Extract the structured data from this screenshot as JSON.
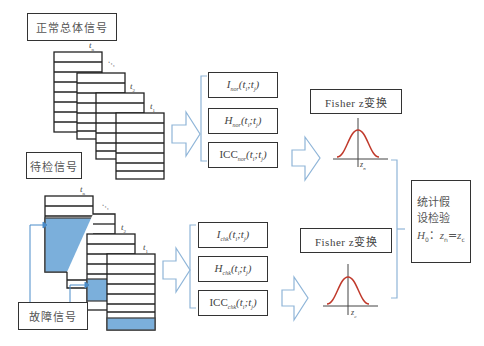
{
  "left": {
    "normal_signal_label": "正常总体信号",
    "test_signal_label": "待检信号",
    "fault_signal_label": "故障信号",
    "top_stack_labels": [
      "t",
      "t",
      "t"
    ],
    "top_stack_subs": [
      "n",
      "2",
      "1"
    ],
    "bottom_stack_labels": [
      "t",
      "t",
      "t"
    ],
    "bottom_stack_subs": [
      "n",
      "2",
      "1"
    ],
    "ellipsis": "···"
  },
  "normal_features": {
    "items": [
      {
        "sym": "I",
        "sub": "nor",
        "args": "(t",
        "a1": "i",
        "mid": ";t",
        "a2": "j",
        "close": ")"
      },
      {
        "sym": "H",
        "sub": "nor",
        "args": "(t",
        "a1": "i",
        "mid": ";t",
        "a2": "j",
        "close": ")"
      },
      {
        "sym": "ICC",
        "sub": "nor",
        "args": "(t",
        "a1": "i",
        "mid": ";t",
        "a2": "j",
        "close": ")"
      }
    ]
  },
  "check_features": {
    "items": [
      {
        "sym": "I",
        "sub": "chk",
        "args": "(t",
        "a1": "i",
        "mid": ";t",
        "a2": "j",
        "close": ")"
      },
      {
        "sym": "H",
        "sub": "chk",
        "args": "(t",
        "a1": "i",
        "mid": ";t",
        "a2": "j",
        "close": ")"
      },
      {
        "sym": "ICC",
        "sub": "chk",
        "args": "(t",
        "a1": "i",
        "mid": ";t",
        "a2": "j",
        "close": ")"
      }
    ]
  },
  "fisher": {
    "top_label": "Fisher z变换",
    "bottom_label": "Fisher z变换",
    "top_z": "z",
    "top_z_sub": "n",
    "bottom_z": "z",
    "bottom_z_sub": "c"
  },
  "hypothesis": {
    "line1": "统计假",
    "line2": "设检验",
    "h0": "H",
    "h0_sub": "0",
    "colon": "：",
    "eq_left": "z",
    "eq_left_sub": "n",
    "eq": "=",
    "eq_right": "z",
    "eq_right_sub": "c"
  },
  "colors": {
    "fault_fill": "#7bafdb",
    "arrow_stroke": "#8fb5d8",
    "bracket_stroke": "#8fb5d8",
    "curve": "#c0392b",
    "box_stroke": "#333333"
  }
}
